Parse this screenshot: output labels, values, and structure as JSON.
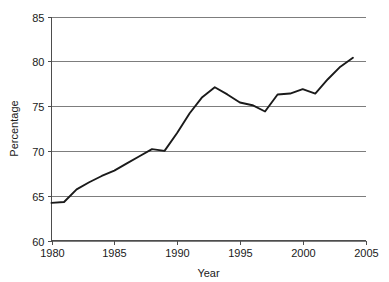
{
  "chart_data": {
    "type": "line",
    "title": "",
    "xlabel": "Year",
    "ylabel": "Percentage",
    "xlim": [
      1980,
      2005
    ],
    "ylim": [
      60,
      85
    ],
    "grid": true,
    "legend": false,
    "legend_position": "none",
    "line_color": "#1a1a1a",
    "grid_color": "#7d7d7d",
    "axis_color": "#4d4d4d",
    "background_color": "#ffffff",
    "xticks": [
      1980,
      1985,
      1990,
      1995,
      2000,
      2005
    ],
    "xtick_labels": [
      "1980",
      "1985",
      "1990",
      "1995",
      "2000",
      "2005"
    ],
    "yticks": [
      60,
      65,
      70,
      75,
      80,
      85
    ],
    "ytick_labels": [
      "60",
      "65",
      "70",
      "75",
      "80",
      "85"
    ],
    "x": [
      1980,
      1981,
      1982,
      1983,
      1984,
      1985,
      1986,
      1987,
      1988,
      1989,
      1990,
      1991,
      1992,
      1993,
      1994,
      1995,
      1996,
      1997,
      1998,
      1999,
      2000,
      2001,
      2002,
      2003,
      2004
    ],
    "series": [
      {
        "name": "Percentage",
        "values": [
          64.2,
          64.3,
          65.7,
          66.5,
          67.2,
          67.8,
          68.6,
          69.4,
          70.2,
          70.0,
          72.0,
          74.2,
          76.0,
          77.1,
          76.3,
          75.4,
          75.1,
          74.4,
          76.3,
          76.4,
          76.9,
          76.4,
          78.0,
          79.4,
          80.4
        ]
      }
    ]
  }
}
